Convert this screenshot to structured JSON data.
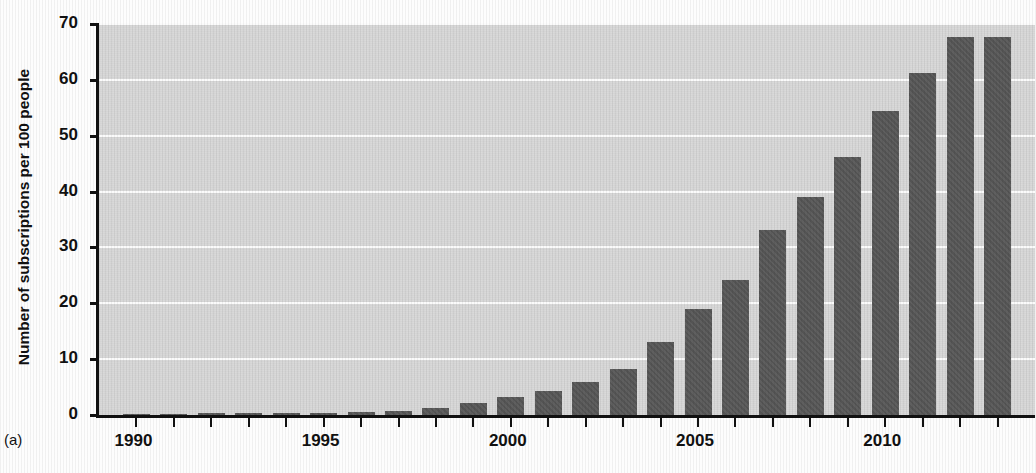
{
  "panel_label": "(a)",
  "chart_data": {
    "type": "bar",
    "title": "Mobile Cellular Subscriptions",
    "xlabel": "",
    "ylabel": "Number of subscriptions per 100 people",
    "ylim": [
      0,
      70
    ],
    "xlim": [
      1989,
      2014
    ],
    "grid": true,
    "legend": "none",
    "bar_color": "#585858",
    "plot_bg": "#d7d7d7",
    "ytick_labels": [
      "70",
      "60",
      "50",
      "40",
      "30",
      "20",
      "10",
      "0"
    ],
    "ytick_values": [
      70,
      60,
      50,
      40,
      30,
      20,
      10,
      0
    ],
    "xtick_labels": [
      "1990",
      "1995",
      "2000",
      "2005",
      "2010"
    ],
    "xtick_values": [
      1990,
      1995,
      2000,
      2005,
      2010
    ],
    "categories": [
      1990,
      1991,
      1992,
      1993,
      1994,
      1995,
      1996,
      1997,
      1998,
      1999,
      2000,
      2001,
      2002,
      2003,
      2004,
      2005,
      2006,
      2007,
      2008,
      2009,
      2010,
      2011,
      2012,
      2013
    ],
    "values": [
      0.2,
      0.2,
      0.3,
      0.3,
      0.4,
      0.4,
      0.5,
      0.7,
      1.2,
      2.2,
      3.2,
      4.3,
      5.9,
      8.3,
      13.0,
      19.0,
      24.2,
      33.1,
      39.0,
      46.2,
      54.5,
      61.2,
      67.6,
      67.6
    ]
  }
}
